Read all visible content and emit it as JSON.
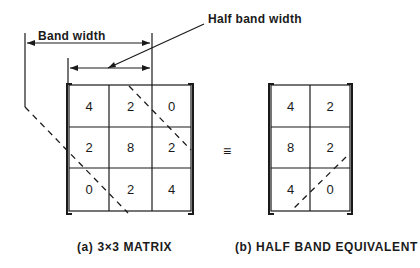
{
  "annotations": {
    "band_width": "Band width",
    "half_band_width": "Half band width",
    "equivalence_symbol": "≡"
  },
  "matrix_a": {
    "caption": "(a) 3×3 MATRIX",
    "rows": [
      [
        "4",
        "2",
        "0"
      ],
      [
        "2",
        "8",
        "2"
      ],
      [
        "0",
        "2",
        "4"
      ]
    ]
  },
  "matrix_b": {
    "caption": "(b) HALF BAND EQUIVALENT",
    "rows": [
      [
        "4",
        "2"
      ],
      [
        "8",
        "2"
      ],
      [
        "4",
        "0"
      ]
    ]
  }
}
